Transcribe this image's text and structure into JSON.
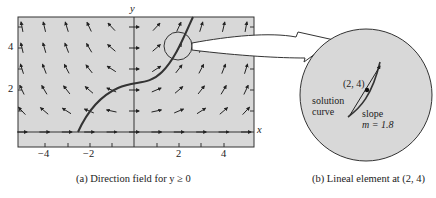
{
  "figure": {
    "panel_a": {
      "caption": "(a) Direction field for y ≥ 0",
      "x_axis_label": "x",
      "y_axis_label": "y",
      "x_ticks": [
        "−4",
        "−2",
        "2",
        "4"
      ],
      "y_ticks": [
        "2",
        "4"
      ],
      "background": "#d8d8d8"
    },
    "panel_b": {
      "caption": "(b) Lineal element at (2, 4)",
      "point_label": "(2, 4)",
      "curve_label_1": "solution",
      "curve_label_2": "curve",
      "slope_label_1": "slope",
      "slope_label_2": "m = 1.8",
      "background": "#d8d8d8"
    }
  }
}
